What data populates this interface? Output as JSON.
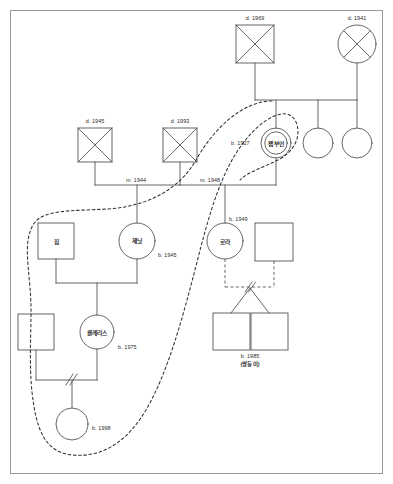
{
  "diagram": {
    "type": "genogram",
    "title_visible": false,
    "border_color": "#9a9a9a",
    "line_color": "#555555",
    "dashed_boundary_color": "#333333",
    "background": "#ffffff"
  },
  "people": {
    "gen1": [
      {
        "id": "gf_paternal",
        "shape": "square",
        "deceased": true,
        "label": "d. 1969",
        "label_pos": "above"
      },
      {
        "id": "gm_paternal",
        "shape": "circle",
        "deceased": true,
        "label": "d. 1941",
        "label_pos": "above"
      },
      {
        "id": "gf_left_a",
        "shape": "square",
        "deceased": true,
        "label": "d. 1945",
        "label_pos": "above"
      },
      {
        "id": "gf_left_b",
        "shape": "square",
        "deceased": true,
        "label": "d. 1993",
        "label_pos": "above"
      }
    ],
    "gen2": [
      {
        "id": "pam",
        "shape": "circle",
        "deceased": false,
        "name": "팸 부인",
        "label": "b. 1927",
        "label_pos": "left",
        "highlight": "double-circle"
      },
      {
        "id": "sister1",
        "shape": "circle",
        "deceased": false,
        "name": "",
        "label": ""
      },
      {
        "id": "sister2",
        "shape": "circle",
        "deceased": false,
        "name": "",
        "label": ""
      },
      {
        "id": "jim",
        "shape": "square",
        "deceased": false,
        "name": "짐",
        "label": ""
      },
      {
        "id": "janet",
        "shape": "circle",
        "deceased": false,
        "name": "제닛",
        "label": "b. 1945",
        "label_pos": "right"
      },
      {
        "id": "laura",
        "shape": "circle",
        "deceased": false,
        "name": "로라",
        "label": "b. 1949",
        "label_pos": "above-right"
      },
      {
        "id": "laura_spouse",
        "shape": "square",
        "deceased": false,
        "name": "",
        "label": ""
      }
    ],
    "gen3": [
      {
        "id": "clarice_spouse",
        "shape": "square",
        "deceased": false,
        "name": "",
        "label": ""
      },
      {
        "id": "clarice",
        "shape": "circle",
        "deceased": false,
        "name": "클레리스",
        "label": "b. 1975",
        "label_pos": "right"
      },
      {
        "id": "twin_a",
        "shape": "square",
        "deceased": false,
        "name": "",
        "label": ""
      },
      {
        "id": "twin_b",
        "shape": "square",
        "deceased": false,
        "name": "",
        "label": ""
      }
    ],
    "gen4": [
      {
        "id": "child_1998",
        "shape": "circle",
        "deceased": false,
        "name": "",
        "label": "b. 1998",
        "label_pos": "right"
      }
    ]
  },
  "relations": {
    "marriage_1944": "m. 1944",
    "marriage_1948": "m. 1948",
    "twins_note_line1": "b. 1985",
    "twins_note_line2": "(쌍둥이)"
  },
  "labels": {
    "d_1969": "d. 1969",
    "d_1941": "d. 1941",
    "d_1945": "d. 1945",
    "d_1993": "d. 1993",
    "m_1944": "m. 1944",
    "m_1948": "m. 1948",
    "b_1927": "b. 1927",
    "b_1945": "b. 1945",
    "b_1949": "b. 1949",
    "b_1975": "b. 1975",
    "b_1998": "b. 1998",
    "b_1985": "b. 1985",
    "twins": "(쌍둥이)",
    "name_pam": "팸 부인",
    "name_jim": "짐",
    "name_janet": "제닛",
    "name_laura": "로라",
    "name_clarice": "클레리스"
  }
}
